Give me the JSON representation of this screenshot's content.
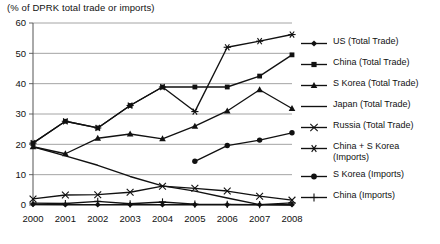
{
  "chart_data": {
    "type": "line",
    "title": "(% of DPRK total trade or imports)",
    "xlabel": "",
    "ylabel": "",
    "categories": [
      2000,
      2001,
      2002,
      2003,
      2004,
      2005,
      2006,
      2007,
      2008
    ],
    "tick_labels_x": [
      "2000",
      "2001",
      "2002",
      "2003",
      "2004",
      "2005",
      "2006",
      "2007",
      "2008"
    ],
    "tick_labels_y": [
      "0",
      "10",
      "20",
      "30",
      "40",
      "50",
      "60"
    ],
    "ylim": [
      0,
      60
    ],
    "ytick_step": 10,
    "grid": "horizontal",
    "legend_position": "right",
    "series": [
      {
        "name": "US (Total Trade)",
        "marker": "diamond",
        "values": [
          0.2,
          0.1,
          0.1,
          0.1,
          0.1,
          0.1,
          0.1,
          0.1,
          0.1
        ]
      },
      {
        "name": "China (Total Trade)",
        "marker": "square",
        "values": [
          20.4,
          27.6,
          25.4,
          32.8,
          38.9,
          38.9,
          38.9,
          42.5,
          49.5
        ]
      },
      {
        "name": "S Korea (Total Trade)",
        "marker": "triangle",
        "values": [
          19.2,
          16.9,
          22.0,
          23.4,
          21.8,
          26.0,
          31.0,
          38.0,
          31.8
        ]
      },
      {
        "name": "Japan (Total Trade)",
        "marker": "none",
        "values": [
          19.2,
          16.2,
          13.1,
          9.4,
          6.3,
          4.6,
          2.3,
          0.1,
          0.0
        ]
      },
      {
        "name": "Russia (Total Trade)",
        "marker": "x",
        "values": [
          2.0,
          3.3,
          3.4,
          4.2,
          6.2,
          5.5,
          4.6,
          2.9,
          1.6
        ]
      },
      {
        "name": "China + S Korea (Imports)",
        "marker": "asterisk",
        "values": [
          20.4,
          27.6,
          25.4,
          32.8,
          38.9,
          30.8,
          52.0,
          54.0,
          56.2
        ]
      },
      {
        "name": "S Korea (Imports)",
        "marker": "circle",
        "values": [
          null,
          null,
          null,
          null,
          null,
          14.4,
          19.6,
          21.4,
          23.8
        ]
      },
      {
        "name": "China (Imports)",
        "marker": "plus",
        "values": [
          0.6,
          0.5,
          1.2,
          0.4,
          1.0,
          0.3,
          0.2,
          0.1,
          0.7
        ]
      }
    ]
  },
  "legend": {
    "items": [
      {
        "label": "US (Total Trade)",
        "marker": "diamond"
      },
      {
        "label": "China (Total Trade)",
        "marker": "square"
      },
      {
        "label": "S Korea (Total Trade)",
        "marker": "triangle"
      },
      {
        "label": "Japan (Total Trade)",
        "marker": "none"
      },
      {
        "label": "Russia (Total Trade)",
        "marker": "x"
      },
      {
        "label": "China + S Korea\n(Imports)",
        "marker": "asterisk"
      },
      {
        "label": "S Korea (Imports)",
        "marker": "circle"
      },
      {
        "label": "China (Imports)",
        "marker": "plus"
      }
    ]
  },
  "colors": {
    "series": "#111111",
    "grid": "#9a9a9a",
    "axis": "#555555",
    "text": "#111111",
    "background": "#ffffff"
  }
}
